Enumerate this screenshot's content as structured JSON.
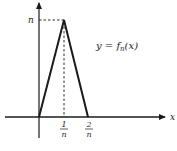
{
  "figure": {
    "function_label": "y = f",
    "function_subscript": "n",
    "function_arg": "(x)",
    "x_axis_label": "x",
    "y_tick_label": "n",
    "x_ticks": [
      {
        "numerator": "1",
        "denominator": "n"
      },
      {
        "numerator": "2",
        "denominator": "n"
      }
    ],
    "colors": {
      "stroke": "#1a1a1a",
      "background": "#ffffff"
    }
  }
}
